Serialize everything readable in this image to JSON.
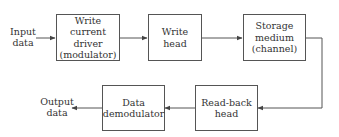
{
  "diagram": {
    "input_label": "Input\ndata",
    "output_label": "Output\ndata",
    "blocks": [
      {
        "id": "write-driver",
        "label": "Write\ncurrent driver\n(modulator)"
      },
      {
        "id": "write-head",
        "label": "Write\nhead"
      },
      {
        "id": "storage-medium",
        "label": "Storage\nmedium\n(channel)"
      },
      {
        "id": "read-back-head",
        "label": "Read-back\nhead"
      },
      {
        "id": "data-demodulator",
        "label": "Data\ndemodulator"
      }
    ],
    "connections": [
      {
        "from": "input",
        "to": "write-driver"
      },
      {
        "from": "write-driver",
        "to": "write-head"
      },
      {
        "from": "write-head",
        "to": "storage-medium"
      },
      {
        "from": "storage-medium",
        "to": "read-back-head"
      },
      {
        "from": "read-back-head",
        "to": "data-demodulator"
      },
      {
        "from": "data-demodulator",
        "to": "output"
      }
    ],
    "colors": {
      "line": "#555555",
      "text": "#333333",
      "background": "#ffffff"
    }
  }
}
